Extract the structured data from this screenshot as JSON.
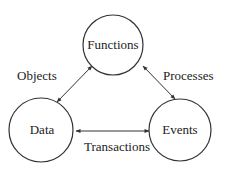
{
  "diagram": {
    "nodes": [
      {
        "id": "functions",
        "label": "Functions",
        "cx": 113,
        "cy": 45,
        "r": 30
      },
      {
        "id": "data",
        "label": "Data",
        "cx": 41,
        "cy": 130,
        "r": 32
      },
      {
        "id": "events",
        "label": "Events",
        "cx": 180,
        "cy": 130,
        "r": 31
      }
    ],
    "edges": [
      {
        "from": "data",
        "to": "functions",
        "label": "Objects",
        "bidirectional": true
      },
      {
        "from": "functions",
        "to": "events",
        "label": "Processes",
        "bidirectional": true
      },
      {
        "from": "data",
        "to": "events",
        "label": "Transactions",
        "bidirectional": true
      }
    ],
    "colors": {
      "stroke": "#333333",
      "text": "#222222",
      "background": "#ffffff"
    }
  }
}
